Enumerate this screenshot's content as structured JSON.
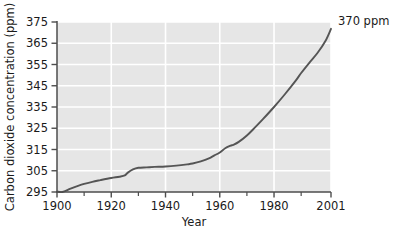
{
  "chart_data": {
    "type": "line",
    "title": "",
    "xlabel": "Year",
    "ylabel": "Carbon dioxide concentration (ppm)",
    "xlim": [
      1900,
      2001
    ],
    "ylim": [
      295,
      375
    ],
    "grid": true,
    "legend_position": "none",
    "x_ticks": [
      1900,
      1920,
      1940,
      1960,
      1980,
      2001
    ],
    "x_tick_labels": [
      "1900",
      "1920",
      "1940",
      "1960",
      "1980",
      "2001"
    ],
    "x_minor_ticks": [
      1910,
      1930,
      1950,
      1970,
      1990
    ],
    "y_ticks": [
      295,
      305,
      315,
      325,
      335,
      345,
      355,
      365,
      375
    ],
    "y_tick_labels": [
      "295",
      "305",
      "315",
      "325",
      "335",
      "345",
      "355",
      "365",
      "375"
    ],
    "series": [
      {
        "name": "Atmospheric CO2 concentration",
        "color": "#555555",
        "x": [
          1900,
          1902,
          1905,
          1908,
          1910,
          1913,
          1916,
          1920,
          1923,
          1925,
          1926,
          1928,
          1930,
          1933,
          1936,
          1940,
          1944,
          1948,
          1950,
          1953,
          1956,
          1958,
          1960,
          1962,
          1964,
          1965,
          1967,
          1970,
          1973,
          1976,
          1980,
          1984,
          1988,
          1990,
          1993,
          1996,
          1999,
          2001
        ],
        "y": [
          295.2,
          295.0,
          296.6,
          298.0,
          298.8,
          299.8,
          300.6,
          301.6,
          302.2,
          302.8,
          304.0,
          305.6,
          306.4,
          306.6,
          306.8,
          307.0,
          307.4,
          308.0,
          308.4,
          309.4,
          310.8,
          312.2,
          313.6,
          315.6,
          316.8,
          317.2,
          318.6,
          321.6,
          325.4,
          329.4,
          335.0,
          341.0,
          347.4,
          351.0,
          355.8,
          360.4,
          366.2,
          371.8
        ]
      }
    ],
    "annotations": [
      {
        "text": "370 ppm",
        "x": 2001,
        "y": 371.8,
        "label": "end-value-callout"
      }
    ]
  },
  "axes": {
    "y_axis_title": "Carbon dioxide concentration (ppm)",
    "x_axis_title": "Year"
  },
  "colors": {
    "plot_background": "#e6e6e6",
    "gridline": "#ffffff",
    "axis_line": "#4d4d4d",
    "line_color": "#555555",
    "text": "#1a1a1a"
  }
}
